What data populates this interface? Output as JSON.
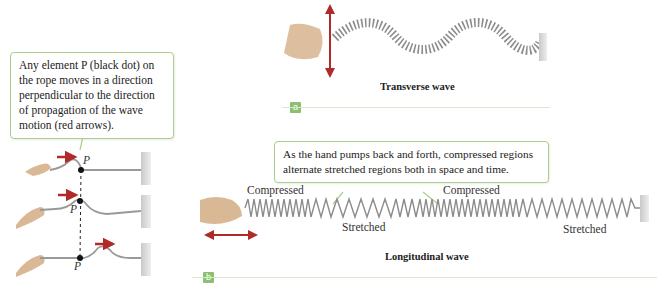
{
  "left_panel": {
    "callout_text": "Any element P (black dot) on the rope moves in a direction perpendicular to the direction of propagation of the wave motion (red arrows).",
    "point_label": "P",
    "frames": [
      {
        "name": "frame-1",
        "point_label": "P"
      },
      {
        "name": "frame-2",
        "point_label": "P"
      },
      {
        "name": "frame-3",
        "point_label": "P"
      }
    ]
  },
  "panel_a": {
    "caption": "Transverse wave",
    "tag": "a"
  },
  "panel_b": {
    "callout_text": "As the hand pumps back and forth, compressed regions alternate stretched regions both in space and time.",
    "labels": {
      "compressed_1": "Compressed",
      "compressed_2": "Compressed",
      "stretched_1": "Stretched",
      "stretched_2": "Stretched"
    },
    "caption": "Longitudinal wave",
    "tag": "b"
  },
  "colors": {
    "accent_green": "#8cc071",
    "callout_border": "#a9cf8a",
    "arrow_red": "#b02a2a",
    "spring_gray": "#8c8c8c",
    "hand_tan": "#d9b896"
  }
}
